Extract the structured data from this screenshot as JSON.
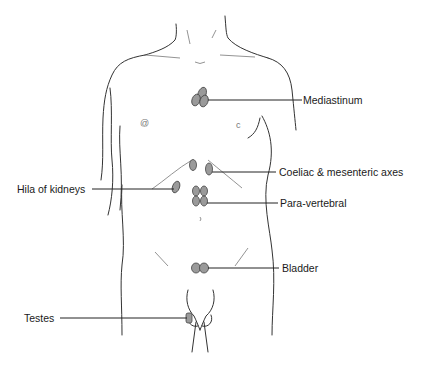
{
  "figure": {
    "type": "anatomical lymph node diagram",
    "labels": [
      {
        "id": "mediastinum",
        "text": "Mediastinum"
      },
      {
        "id": "coeliac",
        "text": "Coeliac & mesenteric axes"
      },
      {
        "id": "hila",
        "text": "Hila of kidneys"
      },
      {
        "id": "paravertebral",
        "text": "Para-vertebral"
      },
      {
        "id": "bladder",
        "text": "Bladder"
      },
      {
        "id": "testes",
        "text": "Testes"
      }
    ],
    "colors": {
      "outline": "#333333",
      "node_fill": "#9a9a9a",
      "leader": "#222222",
      "background": "#ffffff"
    }
  }
}
